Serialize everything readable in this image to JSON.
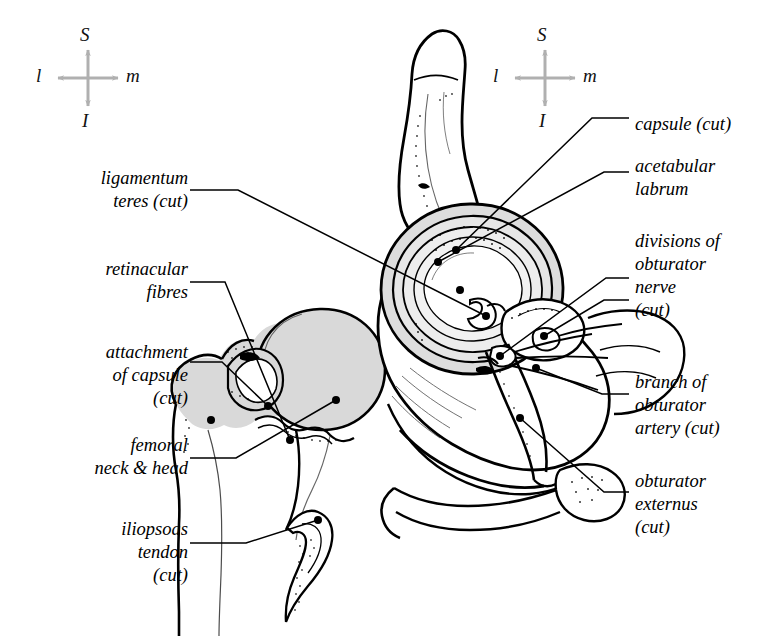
{
  "figure": {
    "type": "anatomical-line-diagram",
    "background_color": "#ffffff",
    "ink_color": "#000000",
    "bone_fill_color": "#d6d6d6",
    "compass_color": "#b0b0b0"
  },
  "compasses": [
    {
      "name": "left-orientation-compass",
      "superior": "S",
      "inferior": "I",
      "lateral": "l",
      "medial": "m",
      "cx": 88,
      "cy": 78
    },
    {
      "name": "right-orientation-compass",
      "superior": "S",
      "inferior": "I",
      "lateral": "l",
      "medial": "m",
      "cx": 545,
      "cy": 78
    }
  ],
  "labels_left": [
    {
      "id": "ligamentum-teres",
      "text": "ligamentum\nteres (cut)",
      "x": 18,
      "y": 167,
      "width": 170,
      "align": "right"
    },
    {
      "id": "retinacular-fibres",
      "text": "retinacular\nfibres",
      "x": 18,
      "y": 258,
      "width": 170,
      "align": "right"
    },
    {
      "id": "attachment-of-capsule",
      "text": "attachment\nof capsule\n(cut)",
      "x": 18,
      "y": 341,
      "width": 170,
      "align": "right"
    },
    {
      "id": "femoral-neck-head",
      "text": "femoral\nneck & head",
      "x": 18,
      "y": 434,
      "width": 170,
      "align": "right"
    },
    {
      "id": "iliopsoas-tendon",
      "text": "iliopsoas\ntendon\n(cut)",
      "x": 18,
      "y": 518,
      "width": 170,
      "align": "right"
    }
  ],
  "labels_right": [
    {
      "id": "capsule-cut",
      "text": "capsule (cut)",
      "x": 635,
      "y": 113,
      "width": 140,
      "align": "left"
    },
    {
      "id": "acetabular-labrum",
      "text": "acetabular\nlabrum",
      "x": 635,
      "y": 155,
      "width": 140,
      "align": "left"
    },
    {
      "id": "divisions-of-obturator-nerve",
      "text": "divisions of\nobturator\nnerve\n(cut)",
      "x": 635,
      "y": 230,
      "width": 140,
      "align": "left"
    },
    {
      "id": "branch-of-obturator-artery",
      "text": "branch of\nobturator\nartery (cut)",
      "x": 635,
      "y": 371,
      "width": 140,
      "align": "left"
    },
    {
      "id": "obturator-externus",
      "text": "obturator\nexternus\n(cut)",
      "x": 635,
      "y": 470,
      "width": 140,
      "align": "left"
    }
  ],
  "structures": [
    {
      "id": "femur-left",
      "name": "femoral head and neck, cut"
    },
    {
      "id": "hip-bone-right",
      "name": "hip bone with acetabulum"
    },
    {
      "id": "acetabular-rings",
      "name": "acetabular labrum and lunate surface"
    },
    {
      "id": "obturator-externus-muscle",
      "name": "obturator externus muscle, cut"
    }
  ]
}
